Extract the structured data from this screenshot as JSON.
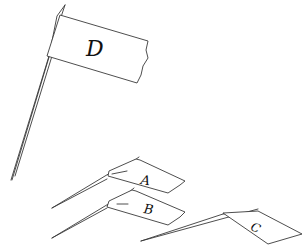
{
  "scene": {
    "description": "Line drawing of four toothpick flags",
    "stroke_color": "#3a3a3a",
    "background": "#ffffff"
  },
  "flags": [
    {
      "id": "D",
      "label": "D"
    },
    {
      "id": "A",
      "label": "A"
    },
    {
      "id": "B",
      "label": "B"
    },
    {
      "id": "C",
      "label": "C"
    }
  ]
}
